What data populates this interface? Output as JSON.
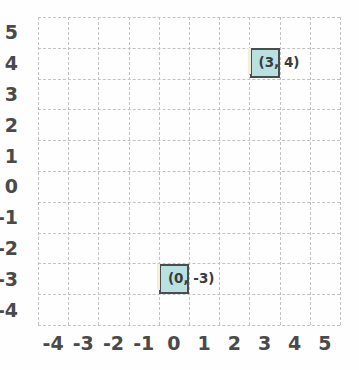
{
  "chart_data": {
    "type": "scatter",
    "title": "",
    "xlabel": "",
    "ylabel": "",
    "xlim": [
      -4.5,
      5.5
    ],
    "ylim": [
      -4.5,
      5.5
    ],
    "grid": true,
    "legend": "none",
    "x_tick_labels": [
      "-4",
      "-3",
      "-2",
      "-1",
      "0",
      "1",
      "2",
      "3",
      "4",
      "5"
    ],
    "y_tick_labels": [
      "5",
      "4",
      "3",
      "2",
      "1",
      "0",
      "-1",
      "-2",
      "-3",
      "-4"
    ],
    "x_ticks": [
      -4,
      -3,
      -2,
      -1,
      0,
      1,
      2,
      3,
      4,
      5
    ],
    "y_ticks": [
      5,
      4,
      3,
      2,
      1,
      0,
      -1,
      -2,
      -3,
      -4
    ],
    "points": [
      {
        "x": 3,
        "y": 4,
        "label": "(3, 4)"
      },
      {
        "x": 0,
        "y": -3,
        "label": "(0, -3)"
      }
    ],
    "marker_style": "filled-square",
    "colors": {
      "marker_fill": "#b9e1e1",
      "marker_border": "#4c4c4c",
      "gridline": "#c2c2c2",
      "tick_text": "#4a4a4a",
      "label_text": "#3b3b3b",
      "background": "#fefefe"
    }
  }
}
